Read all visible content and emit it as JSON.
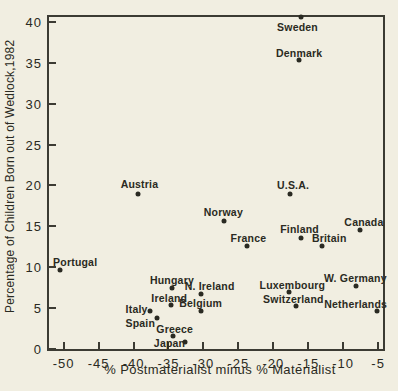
{
  "figure": {
    "paper_color": "#f1eee1",
    "ink_color": "#2a2a22",
    "line_color": "#3c3b33"
  },
  "chart_data": {
    "type": "scatter",
    "title": "",
    "xlabel": "% Postmaterialist minus % Materialist",
    "ylabel": "Percentage of Children Born out of Wedlock,1982",
    "xlim": [
      -52.1,
      -4.3
    ],
    "ylim": [
      0,
      40.6
    ],
    "x_ticks": [
      "-50",
      "-45",
      "-40",
      "-35",
      "-30",
      "-25",
      "-20",
      "-15",
      "-10",
      "-5"
    ],
    "x_tick_values": [
      -50,
      -45,
      -40,
      -35,
      -30,
      -25,
      -20,
      -15,
      -10,
      -5
    ],
    "y_ticks": [
      "0",
      "5",
      "10",
      "15",
      "20",
      "25",
      "30",
      "35",
      "40"
    ],
    "y_tick_values": [
      0,
      5,
      10,
      15,
      20,
      25,
      30,
      35,
      40
    ],
    "grid": false,
    "legend": null,
    "points": [
      {
        "label": "Sweden",
        "x": -16.1,
        "y": 40.6,
        "label_offset": [
          -3,
          10
        ]
      },
      {
        "label": "Denmark",
        "x": -16.3,
        "y": 35.4,
        "label_offset": [
          0,
          -7
        ]
      },
      {
        "label": "U.S.A.",
        "x": -17.6,
        "y": 18.9,
        "label_offset": [
          3,
          -9
        ]
      },
      {
        "label": "Austria",
        "x": -39.3,
        "y": 18.9,
        "label_offset": [
          1,
          -10
        ]
      },
      {
        "label": "Norway",
        "x": -27.0,
        "y": 15.7,
        "label_offset": [
          -1,
          -9
        ]
      },
      {
        "label": "Canada",
        "x": -7.6,
        "y": 14.5,
        "label_offset": [
          4,
          -8
        ]
      },
      {
        "label": "Finland",
        "x": -16.1,
        "y": 13.6,
        "label_offset": [
          -1,
          -9
        ]
      },
      {
        "label": "France",
        "x": -23.7,
        "y": 12.6,
        "label_offset": [
          1,
          -8
        ]
      },
      {
        "label": "Britain",
        "x": -13.0,
        "y": 12.6,
        "label_offset": [
          7,
          -8
        ]
      },
      {
        "label": "Portugal",
        "x": -50.5,
        "y": 9.6,
        "label_offset": [
          15,
          -8
        ]
      },
      {
        "label": "W. Germany",
        "x": -8.1,
        "y": 7.7,
        "label_offset": [
          -1,
          -8
        ]
      },
      {
        "label": "Hungary",
        "x": -34.5,
        "y": 7.4,
        "label_offset": [
          0,
          -8
        ]
      },
      {
        "label": "Luxembourg",
        "x": -17.7,
        "y": 7.0,
        "label_offset": [
          3,
          -7
        ]
      },
      {
        "label": "N. Ireland",
        "x": -30.4,
        "y": 6.7,
        "label_offset": [
          9,
          -8
        ]
      },
      {
        "label": "Ireland",
        "x": -34.6,
        "y": 5.4,
        "label_offset": [
          -2,
          -7
        ]
      },
      {
        "label": "Switzerland",
        "x": -16.7,
        "y": 5.2,
        "label_offset": [
          -3,
          -7
        ]
      },
      {
        "label": "Italy",
        "x": -37.7,
        "y": 4.7,
        "label_offset": [
          -13,
          -2
        ]
      },
      {
        "label": "Netherlands",
        "x": -5.2,
        "y": 4.6,
        "label_offset": [
          -21,
          -7
        ]
      },
      {
        "label": "Belgium",
        "x": -30.4,
        "y": 4.6,
        "label_offset": [
          0,
          -8
        ]
      },
      {
        "label": "Spain",
        "x": -36.6,
        "y": 3.8,
        "label_offset": [
          -17,
          5
        ]
      },
      {
        "label": "Greece",
        "x": -34.4,
        "y": 1.6,
        "label_offset": [
          2,
          -7
        ]
      },
      {
        "label": "Japan",
        "x": -32.7,
        "y": 0.9,
        "label_offset": [
          -15,
          1
        ]
      }
    ]
  }
}
